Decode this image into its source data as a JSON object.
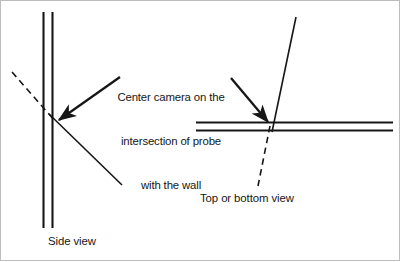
{
  "figure": {
    "background_color": "#ffffff",
    "stroke_color": "#161616",
    "border_color": "#bdbdbd",
    "type": "technical-line-diagram"
  },
  "callout": {
    "line1": "Center camera on the",
    "line2": "intersection of probe",
    "line3": "with the wall"
  },
  "views": {
    "side": {
      "caption": "Side view",
      "wall_orientation": "vertical",
      "probe_orientation": "diagonal-down-right",
      "dashed_segment": "upper-left"
    },
    "top_bottom": {
      "caption": "Top or bottom view",
      "wall_orientation": "horizontal",
      "probe_orientation": "diagonal-up-right",
      "dashed_segment": "lower-left"
    }
  },
  "geometry": {
    "side_wall_line_a_x": 43,
    "side_wall_line_b_x": 52,
    "side_wall_top_y": 12,
    "side_wall_bottom_y": 228,
    "side_intersection_x": 56,
    "side_intersection_y": 122,
    "side_dashed_start_x": 12,
    "side_dashed_start_y": 72,
    "side_probe_end_x": 122,
    "side_probe_end_y": 185,
    "side_arrow_start_x": 120,
    "side_arrow_start_y": 77,
    "top_wall_line_a_y": 122,
    "top_wall_line_b_y": 130,
    "top_wall_left_x": 196,
    "top_wall_right_x": 393,
    "top_intersection_x": 270,
    "top_intersection_y": 126,
    "top_probe_end_x": 296,
    "top_probe_end_y": 17,
    "top_dashed_end_x": 258,
    "top_dashed_end_y": 186,
    "top_arrow_start_x": 231,
    "top_arrow_start_y": 78
  }
}
